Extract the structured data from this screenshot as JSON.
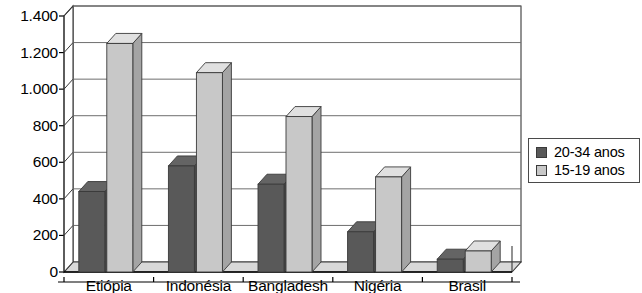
{
  "chart_data": {
    "type": "bar",
    "title": "",
    "subtitle": "",
    "xlabel": "",
    "ylabel": "",
    "categories": [
      "Etiópia",
      "Indonésia",
      "Bangladesh",
      "Nigéria",
      "Brasil"
    ],
    "series": [
      {
        "name": "20-34 anos",
        "color": "#595959",
        "values": [
          440,
          580,
          480,
          220,
          70
        ]
      },
      {
        "name": "15-19 anos",
        "color": "#c8c8c8",
        "values": [
          1250,
          1090,
          850,
          520,
          115
        ]
      }
    ],
    "ylim": [
      0,
      1400
    ],
    "ytick_values": [
      0,
      200,
      400,
      600,
      800,
      1000,
      1200,
      1400
    ],
    "ytick_labels": [
      "0",
      "200",
      "400",
      "600",
      "800",
      "1.000",
      "1.200",
      "1.400"
    ],
    "grid": true,
    "grid_axis": "y",
    "legend_position": "right",
    "style": "3d-column",
    "annotations": []
  },
  "legend": {
    "entries": [
      {
        "label": "20-34 anos",
        "swatch": "#595959"
      },
      {
        "label": "15-19 anos",
        "swatch": "#c8c8c8"
      }
    ]
  },
  "colors": {
    "series_dark": "#595959",
    "series_light": "#c8c8c8",
    "axis": "#3a3a3a",
    "grid": "#6e6e6e",
    "floor": "#d8d8d8",
    "background": "#ffffff"
  }
}
